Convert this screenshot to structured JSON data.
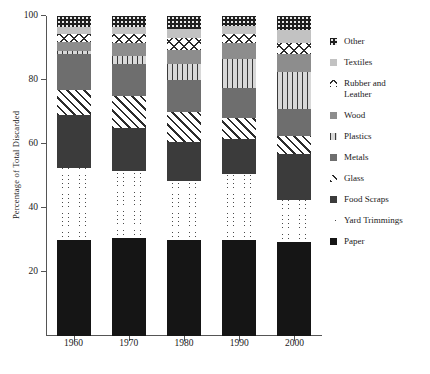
{
  "chart_data": {
    "type": "bar",
    "subtype": "stacked-bar-percentage",
    "title": "",
    "xlabel": "",
    "ylabel": "Percentage of Total Discarded",
    "ylim": [
      0,
      100
    ],
    "yticks": [
      20,
      40,
      60,
      80,
      100
    ],
    "grid": false,
    "legend_position": "right",
    "categories": [
      "1960",
      "1970",
      "1980",
      "1990",
      "2000"
    ],
    "series": [
      {
        "name": "Paper",
        "pattern": "solid-black",
        "color": "#151515",
        "values": [
          30.0,
          30.5,
          30.0,
          30.0,
          29.5
        ]
      },
      {
        "name": "Yard Trimmings",
        "pattern": "brick",
        "color": "#ffffff",
        "values": [
          22.5,
          21.0,
          18.5,
          20.5,
          13.0
        ]
      },
      {
        "name": "Food Scraps",
        "pattern": "solid-dark-gray",
        "color": "#3b3b3b",
        "values": [
          16.5,
          13.5,
          12.0,
          11.0,
          14.5
        ]
      },
      {
        "name": "Glass",
        "pattern": "diagonal-hatch",
        "color": "#ffffff",
        "values": [
          8.0,
          10.0,
          9.5,
          6.5,
          5.5
        ]
      },
      {
        "name": "Metals",
        "pattern": "solid-mid-gray",
        "color": "#6e6e6e",
        "values": [
          11.0,
          10.0,
          10.0,
          9.5,
          8.5
        ]
      },
      {
        "name": "Plastics",
        "pattern": "fine-vertical",
        "color": "#d8d8d8",
        "values": [
          1.0,
          2.5,
          5.0,
          9.0,
          11.5
        ]
      },
      {
        "name": "Wood",
        "pattern": "solid-light-gray",
        "color": "#8d8d8d",
        "values": [
          3.0,
          4.0,
          4.5,
          5.0,
          5.5
        ]
      },
      {
        "name": "Rubber and Leather",
        "pattern": "cross-hatch",
        "color": "#ffffff",
        "values": [
          2.5,
          3.0,
          3.5,
          3.0,
          3.5
        ]
      },
      {
        "name": "Textiles",
        "pattern": "solid-pale-gray",
        "color": "#c2c2c2",
        "values": [
          2.0,
          2.0,
          3.0,
          2.5,
          4.0
        ]
      },
      {
        "name": "Other",
        "pattern": "checkerboard",
        "color": "#e8e8e8",
        "values": [
          3.5,
          3.5,
          4.0,
          3.0,
          4.5
        ]
      }
    ]
  },
  "axis": {
    "y_title": "Percentage of Total Discarded",
    "y_tick_labels": [
      "20",
      "40",
      "60",
      "80",
      "100"
    ],
    "x_tick_labels": [
      "1960",
      "1970",
      "1980",
      "1990",
      "2000"
    ]
  },
  "legend": {
    "items": [
      {
        "label": "Other",
        "key": "Other"
      },
      {
        "label": "Textiles",
        "key": "Textiles"
      },
      {
        "label": "Rubber and\nLeather",
        "key": "Rubber and Leather"
      },
      {
        "label": "Wood",
        "key": "Wood"
      },
      {
        "label": "Plastics",
        "key": "Plastics"
      },
      {
        "label": "Metals",
        "key": "Metals"
      },
      {
        "label": "Glass",
        "key": "Glass"
      },
      {
        "label": "Food Scraps",
        "key": "Food Scraps"
      },
      {
        "label": "Yard Trimmings",
        "key": "Yard Trimmings"
      },
      {
        "label": "Paper",
        "key": "Paper"
      }
    ]
  }
}
